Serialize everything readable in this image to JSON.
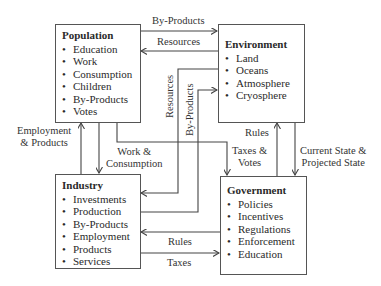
{
  "nodes": {
    "population": {
      "title": "Population",
      "items": [
        "Education",
        "Work",
        "Consumption",
        "Children",
        "By-Products",
        "Votes"
      ]
    },
    "environment": {
      "title": "Environment",
      "items": [
        "Land",
        "Oceans",
        "Atmosphere",
        "Cryosphere"
      ]
    },
    "industry": {
      "title": "Industry",
      "items": [
        "Investments",
        "Production",
        "By-Products",
        "Employment",
        "Products",
        "Services"
      ]
    },
    "government": {
      "title": "Government",
      "items": [
        "Policies",
        "Incentives",
        "Regulations",
        "Enforcement",
        "Education"
      ]
    }
  },
  "edges": {
    "pop_to_env": "By-Products",
    "env_to_pop": "Resources",
    "env_to_ind": "Resources",
    "ind_to_env": "By-Products",
    "ind_to_pop_line1": "Employment",
    "ind_to_pop_line2": "& Products",
    "pop_to_ind_line1": "Work &",
    "pop_to_ind_line2": "Consumption",
    "pop_to_gov_line1": "Taxes &",
    "pop_to_gov_line2": "Votes",
    "gov_to_env": "Rules",
    "env_to_gov_line1": "Current State &",
    "env_to_gov_line2": "Projected State",
    "gov_to_ind": "Rules",
    "ind_to_gov": "Taxes"
  }
}
